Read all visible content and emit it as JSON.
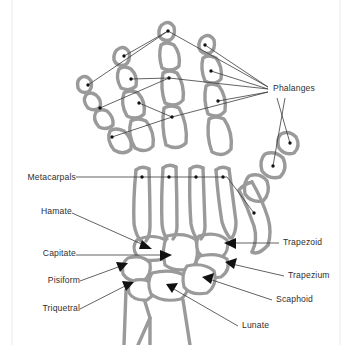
{
  "figure": {
    "background_color": "#ffffff",
    "bone_stroke_color": "#9a9a9a",
    "leader_line_color": "#3b3b3b",
    "marker_color": "#111111",
    "text_color": "#2f2f2f"
  },
  "labels": {
    "phalanges": "Phalanges",
    "metacarpals": "Metacarpals",
    "hamate": "Hamate",
    "capitate": "Capitate",
    "pisiform": "Pisiform",
    "triquetral": "Triquetral",
    "trapezoid": "Trapezoid",
    "trapezium": "Trapezium",
    "scaphoid": "Scaphoid",
    "lunate": "Lunate"
  },
  "annotations": [
    {
      "id": "phalanges",
      "label": "Phalanges",
      "side": "right",
      "marker": "dot",
      "x": 273,
      "y": 89,
      "count": 5
    },
    {
      "id": "metacarpals",
      "label": "Metacarpals",
      "side": "left",
      "marker": "dot",
      "x": 16,
      "y": 178,
      "count": 5
    },
    {
      "id": "hamate",
      "label": "Hamate",
      "side": "left",
      "marker": "arrow",
      "x": 38,
      "y": 212
    },
    {
      "id": "capitate",
      "label": "Capitate",
      "side": "left",
      "marker": "arrow",
      "x": 24,
      "y": 254
    },
    {
      "id": "pisiform",
      "label": "Pisiform",
      "side": "left",
      "marker": "arrow",
      "x": 43,
      "y": 283
    },
    {
      "id": "triquetral",
      "label": "Triquetral",
      "side": "left",
      "marker": "arrow",
      "x": 36,
      "y": 310
    },
    {
      "id": "trapezoid",
      "label": "Trapezoid",
      "side": "right",
      "marker": "arrow",
      "x": 283,
      "y": 243
    },
    {
      "id": "trapezium",
      "label": "Trapezium",
      "side": "right",
      "marker": "arrow",
      "x": 288,
      "y": 277
    },
    {
      "id": "scaphoid",
      "label": "Scaphoid",
      "side": "right",
      "marker": "arrow",
      "x": 276,
      "y": 301
    },
    {
      "id": "lunate",
      "label": "Lunate",
      "side": "right",
      "marker": "arrow",
      "x": 242,
      "y": 326
    }
  ],
  "carpal_bones": [
    "Hamate",
    "Capitate",
    "Pisiform",
    "Triquetral",
    "Trapezoid",
    "Trapezium",
    "Scaphoid",
    "Lunate"
  ],
  "bone_groups": [
    "Phalanges",
    "Metacarpals",
    "Carpals"
  ]
}
